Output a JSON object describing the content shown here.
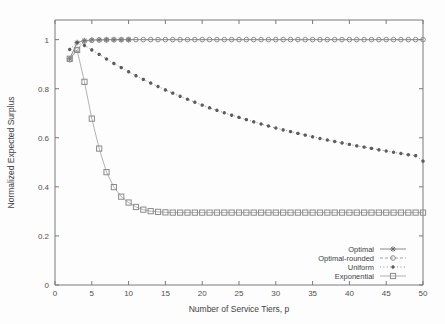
{
  "figure": {
    "background": "#fdfdfd",
    "frame_color": "#7a7a7a",
    "ink_color": "#4f4f4f"
  },
  "chart_data": {
    "type": "line",
    "title": "",
    "subtitle": "",
    "xlabel": "Number of Service Tiers, p",
    "ylabel": "Normalized Expected Surplus",
    "xlim": [
      0,
      50
    ],
    "ylim": [
      0,
      1.08
    ],
    "xticks": [
      0,
      5,
      10,
      15,
      20,
      25,
      30,
      35,
      40,
      45,
      50
    ],
    "xticklabels": [
      "0",
      "5",
      "10",
      "15",
      "20",
      "25",
      "30",
      "35",
      "40",
      "45",
      "50"
    ],
    "yticks": [
      0,
      0.2,
      0.4,
      0.6,
      0.8,
      1
    ],
    "yticklabels": [
      "0",
      "0.2",
      "0.4",
      "0.6",
      "0.8",
      "1"
    ],
    "grid": false,
    "legend_position": "lower right",
    "x": [
      2,
      3,
      4,
      5,
      6,
      7,
      8,
      9,
      10,
      11,
      12,
      13,
      14,
      15,
      16,
      17,
      18,
      19,
      20,
      21,
      22,
      23,
      24,
      25,
      26,
      27,
      28,
      29,
      30,
      31,
      32,
      33,
      34,
      35,
      36,
      37,
      38,
      39,
      40,
      41,
      42,
      43,
      44,
      45,
      46,
      47,
      48,
      49,
      50
    ],
    "series": [
      {
        "name": "Optimal",
        "color": "#6b6b6b",
        "linestyle": "solid",
        "marker": "star",
        "values": [
          0.922,
          0.988,
          0.996,
          0.9985,
          0.9993,
          0.9997,
          0.9998,
          0.9999,
          1.0,
          1.0,
          1.0,
          1.0,
          1.0,
          1.0,
          1.0,
          1.0,
          1.0,
          1.0,
          1.0,
          1.0,
          1.0,
          1.0,
          1.0,
          1.0,
          1.0,
          1.0,
          1.0,
          1.0,
          1.0,
          1.0,
          1.0,
          1.0,
          1.0,
          1.0,
          1.0,
          1.0,
          1.0,
          1.0,
          1.0,
          1.0,
          1.0,
          1.0,
          1.0,
          1.0,
          1.0,
          1.0,
          1.0,
          1.0,
          1.0
        ]
      },
      {
        "name": "Optimal-rounded",
        "color": "#8c8c8c",
        "linestyle": "dashed",
        "marker": "open-circle",
        "values": [
          0.918,
          0.958,
          0.994,
          0.997,
          0.9985,
          0.9992,
          0.9996,
          0.9998,
          0.9999,
          1.0,
          1.0,
          1.0,
          1.0,
          1.0,
          1.0,
          1.0,
          1.0,
          1.0,
          1.0,
          1.0,
          1.0,
          1.0,
          1.0,
          1.0,
          1.0,
          1.0,
          1.0,
          1.0,
          1.0,
          1.0,
          1.0,
          1.0,
          1.0,
          1.0,
          1.0,
          1.0,
          1.0,
          1.0,
          1.0,
          1.0,
          1.0,
          1.0,
          1.0,
          1.0,
          1.0,
          1.0,
          1.0,
          1.0,
          1.0
        ]
      },
      {
        "name": "Uniform",
        "color": "#5c5c5c",
        "linestyle": "dotted",
        "marker": "small-star",
        "values": [
          0.96,
          0.988,
          0.976,
          0.958,
          0.94,
          0.921,
          0.903,
          0.886,
          0.869,
          0.853,
          0.838,
          0.823,
          0.809,
          0.795,
          0.782,
          0.769,
          0.757,
          0.745,
          0.733,
          0.722,
          0.712,
          0.702,
          0.692,
          0.683,
          0.674,
          0.665,
          0.656,
          0.648,
          0.64,
          0.632,
          0.625,
          0.618,
          0.611,
          0.604,
          0.597,
          0.591,
          0.585,
          0.579,
          0.573,
          0.567,
          0.562,
          0.557,
          0.551,
          0.546,
          0.541,
          0.536,
          0.531,
          0.527,
          0.505
        ]
      },
      {
        "name": "Exponential",
        "color": "#8a8a8a",
        "linestyle": "solid-thin",
        "marker": "open-square",
        "values": [
          0.922,
          0.958,
          0.828,
          0.678,
          0.556,
          0.46,
          0.399,
          0.36,
          0.336,
          0.318,
          0.307,
          0.301,
          0.298,
          0.296,
          0.295,
          0.295,
          0.295,
          0.295,
          0.295,
          0.295,
          0.295,
          0.295,
          0.295,
          0.295,
          0.295,
          0.295,
          0.295,
          0.295,
          0.295,
          0.295,
          0.295,
          0.295,
          0.295,
          0.295,
          0.295,
          0.295,
          0.295,
          0.295,
          0.295,
          0.295,
          0.295,
          0.295,
          0.295,
          0.295,
          0.295,
          0.295,
          0.295,
          0.295,
          0.295
        ]
      }
    ],
    "legend": [
      {
        "label": "Optimal",
        "marker": "star",
        "linestyle": "solid"
      },
      {
        "label": "Optimal-rounded",
        "marker": "open-circle",
        "linestyle": "dashed"
      },
      {
        "label": "Uniform",
        "marker": "small-star",
        "linestyle": "dotted"
      },
      {
        "label": "Exponential",
        "marker": "open-square",
        "linestyle": "solid-thin"
      }
    ]
  }
}
